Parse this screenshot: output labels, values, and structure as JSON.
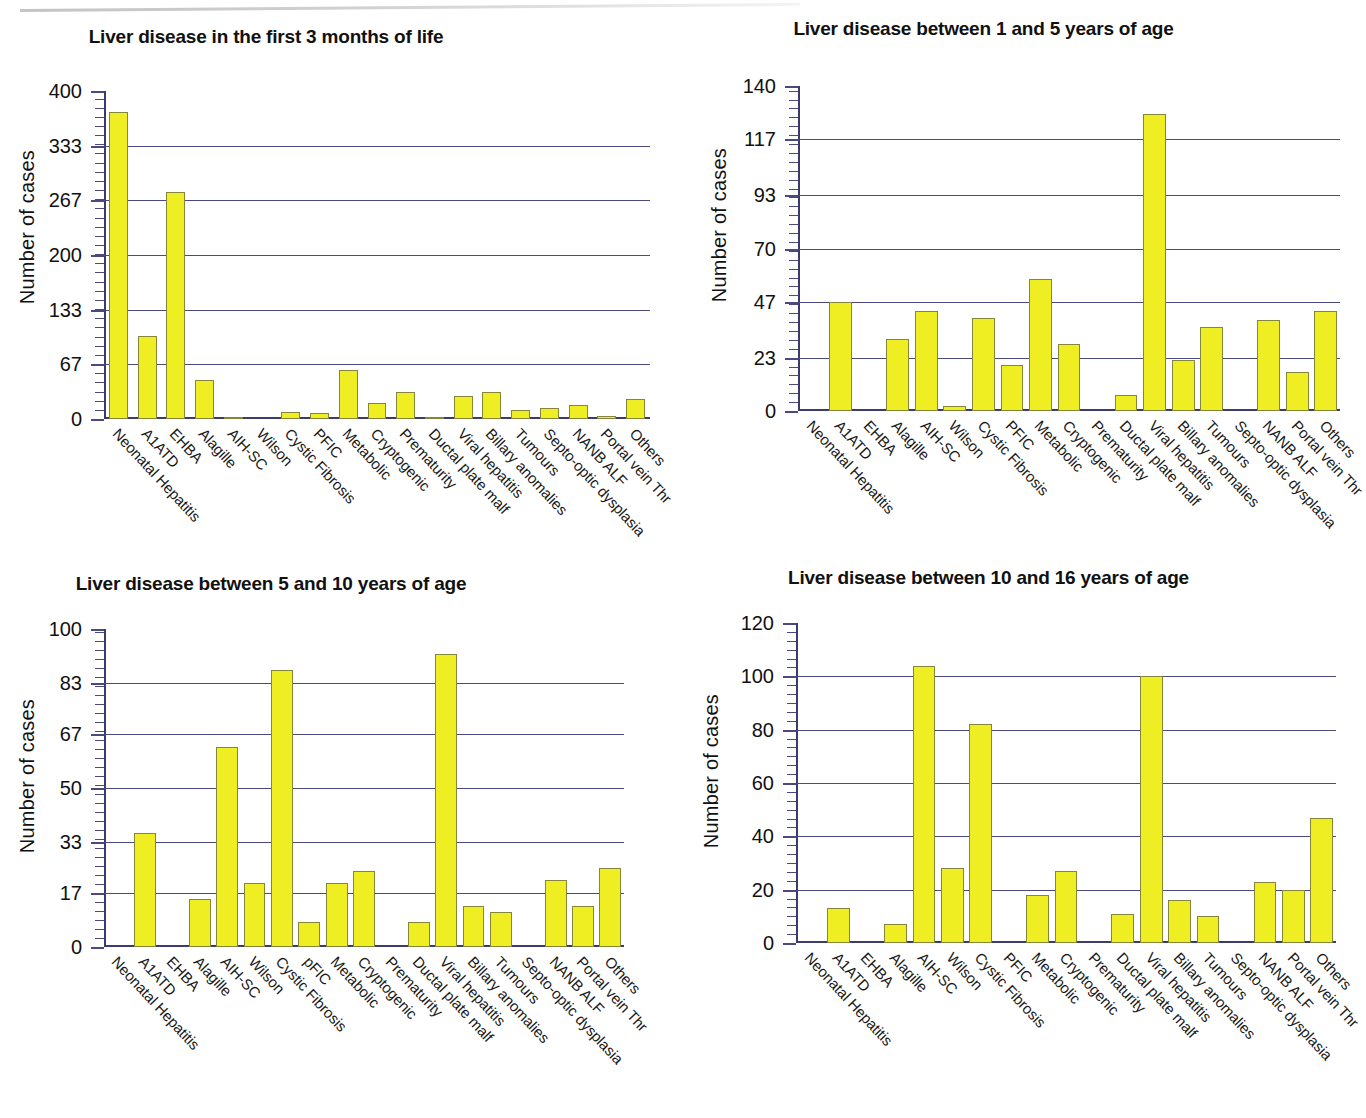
{
  "figure": {
    "ylabel": "Number of cases",
    "bar_color": "#eeee22",
    "bar_border_color": "#86863a",
    "grid_color": "#4a4a80",
    "categories": [
      "Neonatal Hepatitis",
      "A1ATD",
      "EHBA",
      "Alagille",
      "AIH-SC",
      "Wilson",
      "Cystic Fibrosis",
      "PFIC",
      "Metabolic",
      "Cryptogenic",
      "Prematurity",
      "Ductal plate malf",
      "Viral hepatitis",
      "Billary anomalies",
      "Tumours",
      "Septo-optic dysplasia",
      "NANB ALF",
      "Portal vein Thr",
      "Others"
    ]
  },
  "chart_data": [
    {
      "type": "bar",
      "title": "Liver disease in the first 3 months of life",
      "xlabel": "",
      "ylabel": "Number of cases",
      "ylim": [
        0,
        400
      ],
      "yticks": [
        0,
        67,
        133,
        200,
        267,
        333,
        400
      ],
      "ytick_labels": [
        "0",
        "67",
        "133",
        "200",
        "267",
        "333",
        "400"
      ],
      "grid": true,
      "legend": "none",
      "categories": [
        "Neonatal Hepatitis",
        "A1ATD",
        "EHBA",
        "Alagille",
        "AIH-SC",
        "Wilson",
        "Cystic Fibrosis",
        "PFIC",
        "Metabolic",
        "Cryptogenic",
        "Prematurity",
        "Ductal plate malf",
        "Viral hepatitis",
        "Billary anomalies",
        "Tumours",
        "Septo-optic dysplasia",
        "NANB ALF",
        "Portal vein Thr",
        "Others"
      ],
      "values": [
        374,
        101,
        277,
        48,
        2,
        0,
        8,
        7,
        60,
        19,
        33,
        3,
        28,
        33,
        11,
        13,
        17,
        4,
        24
      ]
    },
    {
      "type": "bar",
      "title": "Liver disease between 1 and 5 years of age",
      "xlabel": "",
      "ylabel": "Number of cases",
      "ylim": [
        0,
        140
      ],
      "yticks": [
        0,
        23,
        47,
        70,
        93,
        117,
        140
      ],
      "ytick_labels": [
        "0",
        "23",
        "47",
        "70",
        "93",
        "117",
        "140"
      ],
      "grid": true,
      "legend": "none",
      "categories": [
        "Neonatal Hepatitis",
        "A1ATD",
        "EHBA",
        "Alagille",
        "AIH-SC",
        "Wilson",
        "Cystic Fibrosis",
        "PFIC",
        "Metabolic",
        "Cryptogenic",
        "Prematurity",
        "Ductal plate malf",
        "Viral hepatitis",
        "Billary anomalies",
        "Tumours",
        "Septo-optic dysplasia",
        "NANB ALF",
        "Portal vein Thr",
        "Others"
      ],
      "values": [
        0,
        47,
        0,
        31,
        43,
        2,
        40,
        20,
        57,
        29,
        0,
        7,
        128,
        22,
        36,
        0,
        39,
        17,
        43
      ]
    },
    {
      "type": "bar",
      "title": "Liver disease between 5 and 10 years of age",
      "xlabel": "",
      "ylabel": "Number of cases",
      "ylim": [
        0,
        100
      ],
      "yticks": [
        0,
        17,
        33,
        50,
        67,
        83,
        100
      ],
      "ytick_labels": [
        "0",
        "17",
        "33",
        "50",
        "67",
        "83",
        "100"
      ],
      "grid": true,
      "legend": "none",
      "categories": [
        "Neonatal Hepatitis",
        "A1ATD",
        "EHBA",
        "Alagille",
        "AIH-SC",
        "Wilson",
        "Cystic Fibrosis",
        "pFIC",
        "Metabolic",
        "Cryptogenic",
        "Prematurity",
        "Ductal plate malf",
        "Viral hepatitis",
        "Billary anomalies",
        "Tumours",
        "Septo-optic dysplasia",
        "NANB ALF",
        "Portal vein Thr",
        "Others"
      ],
      "values": [
        0,
        36,
        0,
        15,
        63,
        20,
        87,
        8,
        20,
        24,
        0,
        8,
        92,
        13,
        11,
        0,
        21,
        13,
        25
      ]
    },
    {
      "type": "bar",
      "title": "Liver disease between 10 and 16 years of age",
      "xlabel": "",
      "ylabel": "Number of cases",
      "ylim": [
        0,
        120
      ],
      "yticks": [
        0,
        20,
        40,
        60,
        80,
        100,
        120
      ],
      "ytick_labels": [
        "0",
        "20",
        "40",
        "60",
        "80",
        "100",
        "120"
      ],
      "grid": true,
      "legend": "none",
      "categories": [
        "Neonatal Hepatitis",
        "A1ATD",
        "EHBA",
        "Alagille",
        "AIH-SC",
        "Wilson",
        "Cystic Fibrosis",
        "PFIC",
        "Metabolic",
        "Cryptogenic",
        "Prematurity",
        "Ductal plate malf",
        "Viral hepatitis",
        "Billary anomalies",
        "Tumours",
        "Septo-optic dysplasia",
        "NANB ALF",
        "Portal vein Thr",
        "Others"
      ],
      "values": [
        0,
        13,
        0,
        7,
        104,
        28,
        82,
        0,
        18,
        27,
        0,
        11,
        100,
        16,
        10,
        0,
        23,
        20,
        47
      ]
    }
  ]
}
